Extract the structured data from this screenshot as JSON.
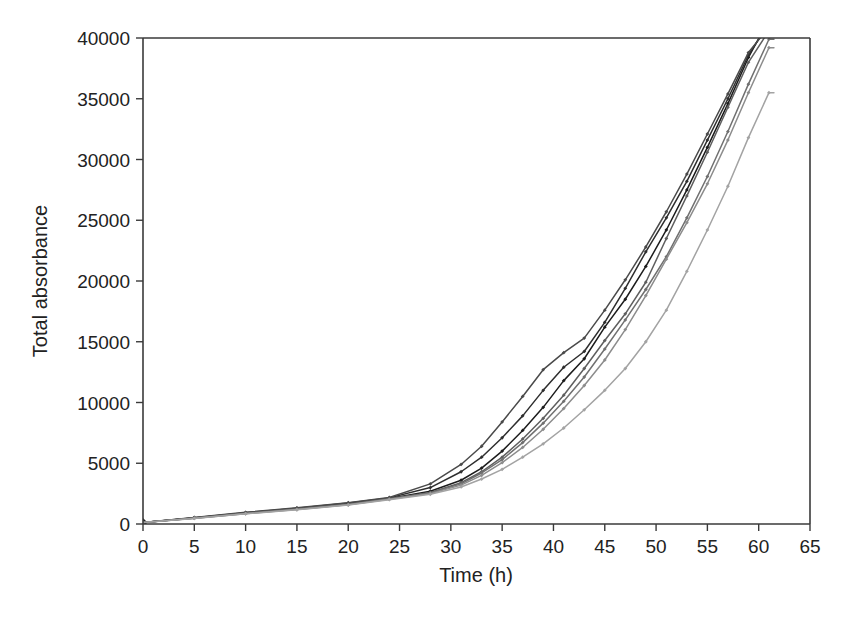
{
  "figure": {
    "background_color": "#ffffff",
    "axis_color": "#3a3a3a",
    "text_color": "#222222"
  },
  "chart_data": {
    "type": "line",
    "title": "",
    "subtitle": "",
    "xlabel": "Time (h)",
    "ylabel": "Total absorbance",
    "xlim": [
      0,
      65
    ],
    "ylim": [
      0,
      40000
    ],
    "xticks": [
      0,
      5,
      10,
      15,
      20,
      25,
      30,
      35,
      40,
      45,
      50,
      55,
      60,
      65
    ],
    "yticks": [
      0,
      5000,
      10000,
      15000,
      20000,
      25000,
      30000,
      35000,
      40000
    ],
    "xtick_labels": [
      "0",
      "5",
      "10",
      "15",
      "20",
      "25",
      "30",
      "35",
      "40",
      "45",
      "50",
      "55",
      "60",
      "65"
    ],
    "ytick_labels": [
      "0",
      "5000",
      "10000",
      "15000",
      "20000",
      "25000",
      "30000",
      "35000",
      "40000"
    ],
    "grid": false,
    "legend": false,
    "legend_position": "none",
    "marker": "diamond",
    "annotations": [],
    "series": [
      {
        "name": "Replicate 1",
        "color": "#1c1c1c",
        "line_width": 1.5,
        "x": [
          0,
          5,
          10,
          15,
          20,
          24,
          28,
          31,
          33,
          35,
          37,
          39,
          41,
          43,
          45,
          47,
          49,
          51,
          53,
          55,
          57,
          59,
          61
        ],
        "y": [
          120,
          500,
          900,
          1250,
          1650,
          2100,
          2700,
          3600,
          4600,
          6000,
          7700,
          9600,
          11800,
          13600,
          16200,
          18500,
          21200,
          24200,
          27500,
          31000,
          34600,
          38400,
          41500
        ]
      },
      {
        "name": "Replicate 2",
        "color": "#2e2e2e",
        "line_width": 1.5,
        "x": [
          0,
          5,
          10,
          15,
          20,
          24,
          28,
          31,
          33,
          35,
          37,
          39,
          41,
          43,
          45,
          47,
          49,
          51,
          53,
          55,
          57,
          59,
          61
        ],
        "y": [
          120,
          520,
          930,
          1300,
          1720,
          2150,
          3000,
          4300,
          5500,
          7100,
          8900,
          11000,
          12900,
          14200,
          16600,
          19400,
          22400,
          25200,
          28200,
          31600,
          35000,
          38600,
          41200
        ]
      },
      {
        "name": "Replicate 3",
        "color": "#4a4a4a",
        "line_width": 1.5,
        "x": [
          0,
          5,
          10,
          15,
          20,
          24,
          28,
          31,
          33,
          35,
          37,
          39,
          41,
          43,
          45,
          47,
          49,
          51,
          53,
          55,
          57,
          59,
          61
        ],
        "y": [
          120,
          540,
          960,
          1330,
          1750,
          2180,
          3300,
          4900,
          6400,
          8400,
          10500,
          12700,
          14100,
          15300,
          17600,
          20100,
          22800,
          25700,
          28800,
          32100,
          35400,
          38800,
          40900
        ]
      },
      {
        "name": "Replicate 4",
        "color": "#5e5e5e",
        "line_width": 1.5,
        "x": [
          0,
          5,
          10,
          15,
          20,
          24,
          28,
          31,
          33,
          35,
          37,
          39,
          41,
          43,
          45,
          47,
          49,
          51,
          53,
          55,
          57,
          59,
          61
        ],
        "y": [
          120,
          500,
          880,
          1230,
          1620,
          2080,
          2600,
          3400,
          4300,
          5500,
          7000,
          8700,
          10600,
          12800,
          15100,
          17300,
          19900,
          23500,
          27000,
          30600,
          34300,
          38000,
          40600
        ]
      },
      {
        "name": "Replicate 5",
        "color": "#707070",
        "line_width": 1.5,
        "x": [
          0,
          5,
          10,
          15,
          20,
          24,
          28,
          31,
          33,
          35,
          37,
          39,
          41,
          43,
          45,
          47,
          49,
          51,
          53,
          55,
          57,
          59,
          61
        ],
        "y": [
          120,
          480,
          870,
          1210,
          1600,
          2050,
          2550,
          3300,
          4200,
          5300,
          6700,
          8300,
          10100,
          12100,
          14400,
          16800,
          19300,
          22000,
          25200,
          28600,
          32300,
          36200,
          39900
        ]
      },
      {
        "name": "Replicate 6",
        "color": "#8c8c8c",
        "line_width": 1.5,
        "x": [
          0,
          5,
          10,
          15,
          20,
          24,
          28,
          31,
          33,
          35,
          37,
          39,
          41,
          43,
          45,
          47,
          49,
          51,
          53,
          55,
          57,
          59,
          61
        ],
        "y": [
          120,
          470,
          850,
          1190,
          1580,
          2030,
          2500,
          3200,
          4000,
          5050,
          6300,
          7800,
          9500,
          11400,
          13500,
          16000,
          18800,
          21800,
          24800,
          28000,
          31600,
          35500,
          39200
        ]
      },
      {
        "name": "Replicate 7",
        "color": "#a3a3a3",
        "line_width": 1.5,
        "x": [
          0,
          5,
          10,
          15,
          20,
          24,
          28,
          31,
          33,
          35,
          37,
          39,
          41,
          43,
          45,
          47,
          49,
          51,
          53,
          55,
          57,
          59,
          61
        ],
        "y": [
          120,
          460,
          840,
          1170,
          1560,
          2000,
          2450,
          3050,
          3700,
          4500,
          5500,
          6600,
          7900,
          9400,
          11000,
          12800,
          15000,
          17600,
          20800,
          24200,
          27800,
          31800,
          35500
        ]
      }
    ]
  }
}
